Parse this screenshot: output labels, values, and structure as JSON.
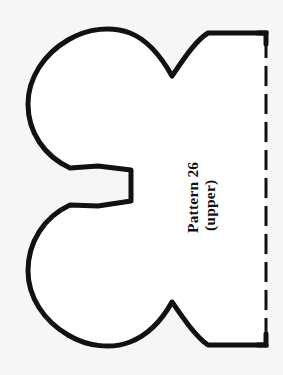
{
  "document": {
    "kind": "sewing-pattern-template",
    "background_color": "#f7f6f7",
    "ink_color": "#111111"
  },
  "labels": {
    "line1": "Pattern 26",
    "line2": "(upper)",
    "orientation": "rotated-90-ccw"
  },
  "pattern": {
    "outline_name": "pattern-outline",
    "stroke_color": "#111111",
    "stroke_width": 5,
    "fill": "#ffffff",
    "fold_edge": {
      "name": "fold-line",
      "style": "dashed",
      "x": 266,
      "y_start": 33,
      "y_end": 345,
      "dash_length": 20,
      "dash_gap": 8,
      "stroke_width": 3
    },
    "features": [
      {
        "name": "upper-lobe",
        "type": "round-lobe",
        "cx": 92,
        "cy": 102,
        "r": 72
      },
      {
        "name": "lower-lobe",
        "type": "round-lobe",
        "cx": 92,
        "cy": 276,
        "r": 72
      },
      {
        "name": "center-tab",
        "type": "rectangular-nub",
        "x": 98,
        "y": 165,
        "w": 33,
        "h": 41
      },
      {
        "name": "upper-notch",
        "type": "v-notch",
        "apex_x": 172,
        "apex_y": 76
      },
      {
        "name": "lower-notch",
        "type": "v-notch",
        "apex_x": 172,
        "apex_y": 302
      }
    ]
  },
  "canvas": {
    "width": 283,
    "height": 375
  }
}
